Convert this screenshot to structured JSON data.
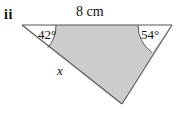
{
  "figure": {
    "part_label": "ii",
    "top_side_label": "8 cm",
    "angle_left_label": "42°",
    "angle_right_label": "54°",
    "unknown_side_label": "x",
    "colors": {
      "shade_fill": "#cccccc",
      "outline": "#555555",
      "text": "#111111",
      "background": "#ffffff"
    },
    "geometry": {
      "vertex_top_left": [
        22,
        25
      ],
      "vertex_top_right": [
        172,
        25
      ],
      "vertex_bottom": [
        122,
        104
      ],
      "arc_radius_left": 34,
      "arc_radius_right": 34,
      "angle_left_degrees": 42,
      "angle_right_degrees": 54
    }
  }
}
